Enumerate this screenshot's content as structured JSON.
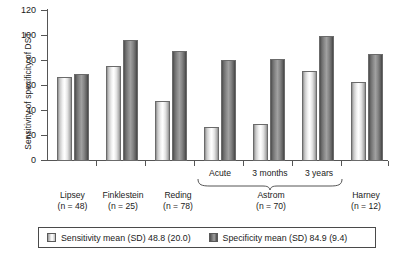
{
  "chart_data": {
    "type": "bar",
    "title": "",
    "xlabel": "",
    "ylabel": "Sensitivity of specificity of DST",
    "ylim": [
      0,
      120
    ],
    "yticks": [
      0,
      20,
      40,
      60,
      80,
      100,
      120
    ],
    "ytick_labels": [
      "0",
      "20",
      "40",
      "60",
      "80",
      "100",
      "120"
    ],
    "grid": false,
    "legend_position": "bottom",
    "categories": [
      "Lipsey",
      "Finklestein",
      "Reding",
      "Acute",
      "3 months",
      "3 years",
      "Harney"
    ],
    "series": [
      {
        "name": "Sensitivity mean (SD) 48.8 (20.0)",
        "short_name": "Sensitivity",
        "color": "#e8e8e8",
        "values": [
          67,
          76,
          48,
          27,
          30,
          72,
          63
        ]
      },
      {
        "name": "Specificity mean (SD) 84.9 (9.4)",
        "short_name": "Specificity",
        "color": "#808080",
        "values": [
          70,
          97,
          88,
          81,
          82,
          100,
          86
        ]
      }
    ],
    "group_labels": [
      {
        "label": "Lipsey",
        "n_text": "(n = 48)",
        "n": 48,
        "covers": [
          "Lipsey"
        ]
      },
      {
        "label": "Finklestein",
        "n_text": "(n = 25)",
        "n": 25,
        "covers": [
          "Finklestein"
        ]
      },
      {
        "label": "Reding",
        "n_text": "(n = 78)",
        "n": 78,
        "covers": [
          "Reding"
        ]
      },
      {
        "label": "Astrom",
        "n_text": "(n = 70)",
        "n": 70,
        "covers": [
          "Acute",
          "3 months",
          "3 years"
        ]
      },
      {
        "label": "Harney",
        "n_text": "(n = 12)",
        "n": 12,
        "covers": [
          "Harney"
        ]
      }
    ],
    "sub_labels": [
      "Acute",
      "3 months",
      "3 years"
    ]
  },
  "axis": {
    "y_label": "Sensitivity of specificity of DST",
    "y_tick_0": "0",
    "y_tick_20": "20",
    "y_tick_40": "40",
    "y_tick_60": "60",
    "y_tick_80": "80",
    "y_tick_100": "100",
    "y_tick_120": "120"
  },
  "x_labels": {
    "lipsey_name": "Lipsey",
    "lipsey_n": "(n = 48)",
    "finklestein_name": "Finklestein",
    "finklestein_n": "(n = 25)",
    "reding_name": "Reding",
    "reding_n": "(n = 78)",
    "acute": "Acute",
    "three_months": "3 months",
    "three_years": "3 years",
    "astrom_name": "Astrom",
    "astrom_n": "(n = 70)",
    "harney_name": "Harney",
    "harney_n": "(n = 12)"
  },
  "legend": {
    "sensitivity_label": "Sensitivity mean (SD) 48.8 (20.0)",
    "specificity_label": "Specificity mean (SD) 84.9 (9.4)",
    "sensitivity_swatch": "light-gray-swatch",
    "specificity_swatch": "dark-gray-swatch"
  }
}
